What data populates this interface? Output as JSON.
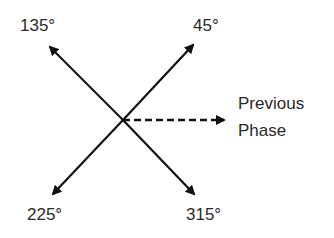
{
  "diagram": {
    "type": "phase-vector-diagram",
    "labels": {
      "angle_135": "135°",
      "angle_45": "45°",
      "angle_225": "225°",
      "angle_315": "315°",
      "reference_line1": "Previous",
      "reference_line2": "Phase"
    },
    "vectors": [
      {
        "angle": "135°",
        "style": "solid"
      },
      {
        "angle": "45°",
        "style": "solid"
      },
      {
        "angle": "225°",
        "style": "solid"
      },
      {
        "angle": "315°",
        "style": "solid"
      },
      {
        "angle": "0°",
        "style": "dashed",
        "label": "Previous Phase"
      }
    ],
    "colors": {
      "stroke": "#111111",
      "text": "#2a2a2a",
      "background": "#ffffff"
    }
  }
}
